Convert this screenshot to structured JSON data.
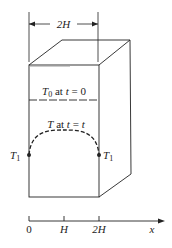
{
  "dimension": {
    "label": "2H"
  },
  "initial_label": {
    "T": "T",
    "sub": "0",
    "text": " at ",
    "t": "t",
    "eq": " = 0"
  },
  "profile_label": {
    "T": "T",
    "text": " at ",
    "t": "t",
    "eq": " = ",
    "t2": "t"
  },
  "boundary_left": {
    "T": "T",
    "sub": "1"
  },
  "boundary_right": {
    "T": "T",
    "sub": "1"
  },
  "axis": {
    "ticks": [
      "0",
      "H",
      "2H"
    ],
    "var": "x"
  },
  "colors": {
    "line": "#222222",
    "background": "#ffffff"
  }
}
